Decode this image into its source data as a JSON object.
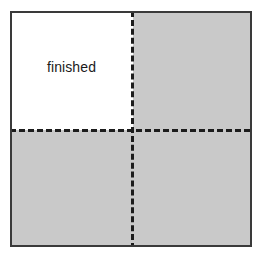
{
  "figure": {
    "type": "area-model-square",
    "border_color": "#3a3a3a",
    "shaded_color": "#c9c9c9",
    "unshaded_color": "#ffffff",
    "divider_color": "#1c1c1c",
    "divider_style": "dashed"
  },
  "labels": {
    "finished": "finished"
  },
  "regions": [
    {
      "name": "top-left",
      "shaded": false,
      "label": "finished"
    },
    {
      "name": "top-right",
      "shaded": true,
      "label": ""
    },
    {
      "name": "bottom-left",
      "shaded": true,
      "label": ""
    },
    {
      "name": "bottom-right",
      "shaded": true,
      "label": ""
    }
  ]
}
